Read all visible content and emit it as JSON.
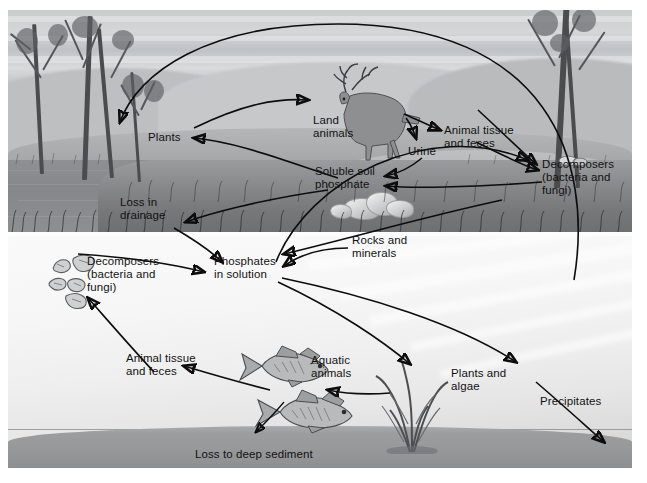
{
  "figure": {
    "panels": [
      {
        "name": "terrestrial",
        "description": "land and shoreline scene"
      },
      {
        "name": "aquatic",
        "description": "underwater scene"
      }
    ]
  },
  "labels": {
    "plants": "Plants",
    "land_animals": "Land\nanimals",
    "urine": "Urine",
    "animal_tissue_feces_land": "Animal tissue\nand feces",
    "decomposers_land": "Decomposers\n(bacteria and\nfungi)",
    "soluble_soil_phosphate": "Soluble soil\nphosphate",
    "loss_in_drainage": "Loss in\ndrainage",
    "decomposers_water": "Decomposers\n(bacteria and\nfungi)",
    "phosphates_in_solution": "Phosphates\nin solution",
    "rocks_and_minerals": "Rocks and\nminerals",
    "animal_tissue_feces_water": "Animal tissue\nand feces",
    "aquatic_animals": "Aquatic\nanimals",
    "plants_and_algae": "Plants and\nalgae",
    "precipitates": "Precipitates",
    "loss_to_deep_sediment": "Loss to deep sediment"
  },
  "nodes": [
    {
      "id": "plants",
      "label": "Plants"
    },
    {
      "id": "land-animals",
      "label": "Land animals"
    },
    {
      "id": "urine",
      "label": "Urine"
    },
    {
      "id": "animal-tissue-land",
      "label": "Animal tissue and feces"
    },
    {
      "id": "decomposers-land",
      "label": "Decomposers (bacteria and fungi)"
    },
    {
      "id": "soluble-soil-phosphate",
      "label": "Soluble soil phosphate"
    },
    {
      "id": "loss-in-drainage",
      "label": "Loss in drainage"
    },
    {
      "id": "decomposers-water",
      "label": "Decomposers (bacteria and fungi)"
    },
    {
      "id": "phosphates-in-solution",
      "label": "Phosphates in solution"
    },
    {
      "id": "rocks-and-minerals",
      "label": "Rocks and minerals"
    },
    {
      "id": "animal-tissue-water",
      "label": "Animal tissue and feces"
    },
    {
      "id": "aquatic-animals",
      "label": "Aquatic animals"
    },
    {
      "id": "plants-and-algae",
      "label": "Plants and algae"
    },
    {
      "id": "precipitates",
      "label": "Precipitates"
    },
    {
      "id": "loss-to-deep-sediment",
      "label": "Loss to deep sediment"
    }
  ],
  "flows": [
    {
      "from": "soluble-soil-phosphate",
      "to": "plants"
    },
    {
      "from": "plants",
      "to": "land-animals"
    },
    {
      "from": "land-animals",
      "to": "urine"
    },
    {
      "from": "land-animals",
      "to": "animal-tissue-land"
    },
    {
      "from": "urine",
      "to": "soluble-soil-phosphate"
    },
    {
      "from": "animal-tissue-land",
      "to": "decomposers-land"
    },
    {
      "from": "decomposers-land",
      "to": "soluble-soil-phosphate"
    },
    {
      "from": "soluble-soil-phosphate",
      "to": "loss-in-drainage"
    },
    {
      "from": "loss-in-drainage",
      "to": "phosphates-in-solution"
    },
    {
      "from": "rocks-and-minerals",
      "to": "phosphates-in-solution"
    },
    {
      "from": "decomposers-water",
      "to": "phosphates-in-solution"
    },
    {
      "from": "phosphates-in-solution",
      "to": "plants-and-algae"
    },
    {
      "from": "phosphates-in-solution",
      "to": "precipitates"
    },
    {
      "from": "plants-and-algae",
      "to": "aquatic-animals"
    },
    {
      "from": "aquatic-animals",
      "to": "animal-tissue-water"
    },
    {
      "from": "animal-tissue-water",
      "to": "decomposers-water"
    },
    {
      "from": "aquatic-animals",
      "to": "loss-to-deep-sediment"
    },
    {
      "from": "precipitates",
      "to": "loss-to-deep-sediment"
    },
    {
      "from": "plants-and-algae",
      "to": "plants"
    },
    {
      "from": "phosphates-in-solution",
      "to": "soluble-soil-phosphate"
    }
  ],
  "colors": {
    "arrow": "#0d0d0d",
    "text": "#121212",
    "sky": "#c9cbcd",
    "water": "#8a8c8e",
    "sediment": "#9c9d9e",
    "frame": "#fdfdfd"
  }
}
